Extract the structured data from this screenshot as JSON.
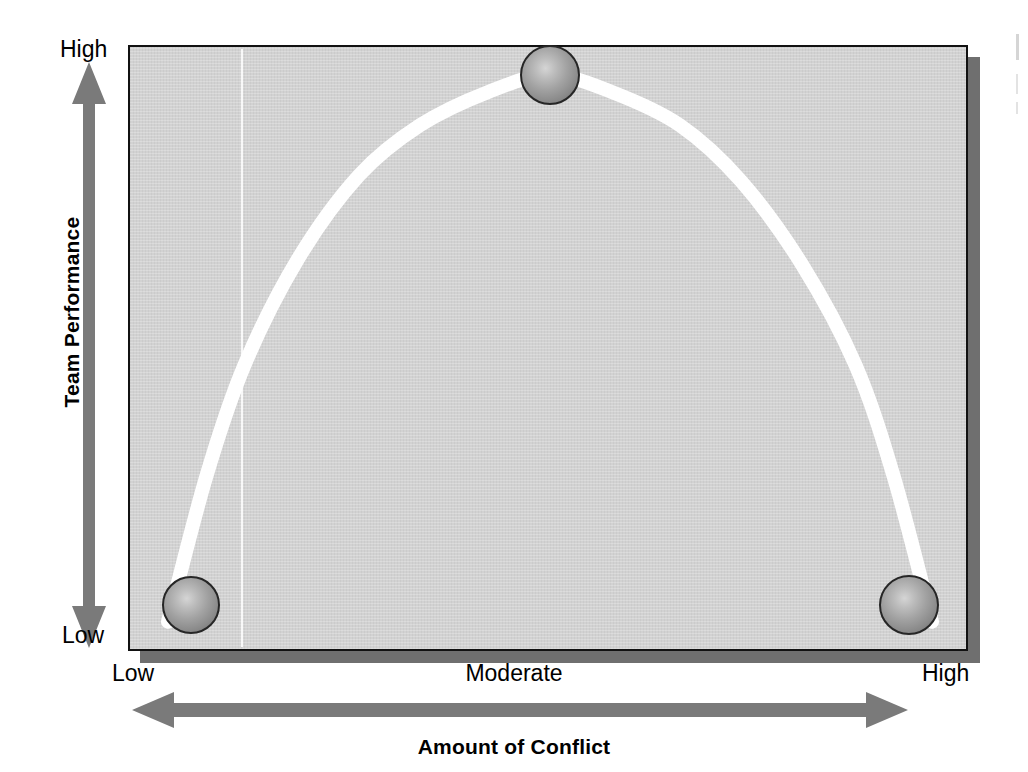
{
  "figure": {
    "panel_bg_color": "#d2d2d2",
    "panel_border_color": "#111111",
    "shadow_color": "#6f6f6f",
    "curve_color": "#ffffff",
    "arrow_color": "#7a7a7a",
    "marker_color": "#8a8a8a"
  },
  "axes": {
    "y_title": "Team Performance",
    "y_ticks": {
      "high": "High",
      "low": "Low"
    },
    "x_title": "Amount of Conflict",
    "x_ticks": {
      "low": "Low",
      "moderate": "Moderate",
      "high": "High"
    }
  },
  "icons": {
    "y_arrow": "double-arrow-vertical-icon",
    "x_arrow": "double-arrow-horizontal-icon",
    "marker": "sphere-marker-icon"
  },
  "chart_data": {
    "type": "line",
    "title": "",
    "subtitle": "",
    "xlabel": "Amount of Conflict",
    "ylabel": "Team Performance",
    "xlim": [
      0,
      1
    ],
    "ylim": [
      0,
      1
    ],
    "grid": false,
    "legend": null,
    "x_tick_labels": [
      "Low",
      "Moderate",
      "High"
    ],
    "x_tick_positions": [
      0,
      0.5,
      1
    ],
    "y_tick_labels": [
      "Low",
      "High"
    ],
    "y_tick_positions": [
      0,
      1
    ],
    "series": [
      {
        "name": "Inverted-U relationship between conflict and team performance",
        "style": "smooth-curve",
        "color": "#ffffff",
        "linewidth": 14,
        "x": [
          0.0,
          0.05,
          0.1,
          0.17,
          0.25,
          0.33,
          0.42,
          0.5,
          0.58,
          0.67,
          0.75,
          0.83,
          0.9,
          0.95,
          1.0
        ],
        "y": [
          0.02,
          0.28,
          0.48,
          0.67,
          0.82,
          0.91,
          0.97,
          1.0,
          0.97,
          0.91,
          0.81,
          0.66,
          0.48,
          0.28,
          0.02
        ]
      }
    ],
    "markers": [
      {
        "label": "Low conflict / Low performance",
        "x": 0.03,
        "y": 0.05
      },
      {
        "label": "Moderate conflict / High performance",
        "x": 0.5,
        "y": 1.0
      },
      {
        "label": "High conflict / Low performance",
        "x": 0.97,
        "y": 0.05
      }
    ],
    "annotation": "Team performance peaks at a moderate amount of conflict and is low at both low and high levels of conflict."
  }
}
